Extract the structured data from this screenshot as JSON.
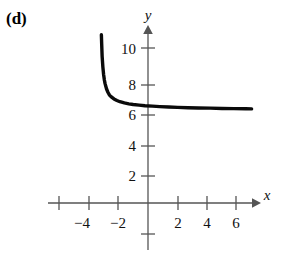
{
  "figure": {
    "panel_label": "(d)",
    "axis_labels": {
      "x": "x",
      "y": "y"
    },
    "x_ticks": [
      {
        "value": -6,
        "label": ""
      },
      {
        "value": -4,
        "label": "−4"
      },
      {
        "value": -2,
        "label": "−2"
      },
      {
        "value": 2,
        "label": "2"
      },
      {
        "value": 4,
        "label": "4"
      },
      {
        "value": 6,
        "label": "6"
      }
    ],
    "y_ticks": [
      {
        "value": -2,
        "label": ""
      },
      {
        "value": 2,
        "label": "2"
      },
      {
        "value": 4,
        "label": "4"
      },
      {
        "value": 6,
        "label": "6"
      },
      {
        "value": 8,
        "label": "8"
      },
      {
        "value": 10,
        "label": "10"
      }
    ]
  },
  "chart_data": {
    "type": "line",
    "title": "",
    "subtitle": "",
    "xlabel": "x",
    "ylabel": "y",
    "xlim": [
      -7,
      7.5
    ],
    "ylim": [
      -3,
      11.5
    ],
    "grid": false,
    "legend": false,
    "annotations": [
      "(d)"
    ],
    "asymptotes": {
      "vertical": -3.2,
      "horizontal": 6.1
    },
    "series": [
      {
        "name": "curve",
        "x": [
          -3.15,
          -3.13,
          -3.1,
          -3.05,
          -3.0,
          -2.95,
          -2.9,
          -2.8,
          -2.7,
          -2.6,
          -2.5,
          -2.3,
          -2.1,
          -1.9,
          -1.6,
          -1.3,
          -1.0,
          -0.6,
          -0.2,
          0.3,
          0.8,
          1.4,
          2.0,
          2.7,
          3.4,
          4.2,
          5.0,
          5.8,
          6.6,
          7.0
        ],
        "y": [
          11.0,
          10.4,
          9.6,
          8.9,
          8.4,
          8.05,
          7.8,
          7.45,
          7.22,
          7.05,
          6.95,
          6.8,
          6.7,
          6.62,
          6.54,
          6.48,
          6.44,
          6.4,
          6.36,
          6.33,
          6.3,
          6.27,
          6.25,
          6.23,
          6.21,
          6.2,
          6.18,
          6.17,
          6.16,
          6.15
        ]
      }
    ]
  }
}
